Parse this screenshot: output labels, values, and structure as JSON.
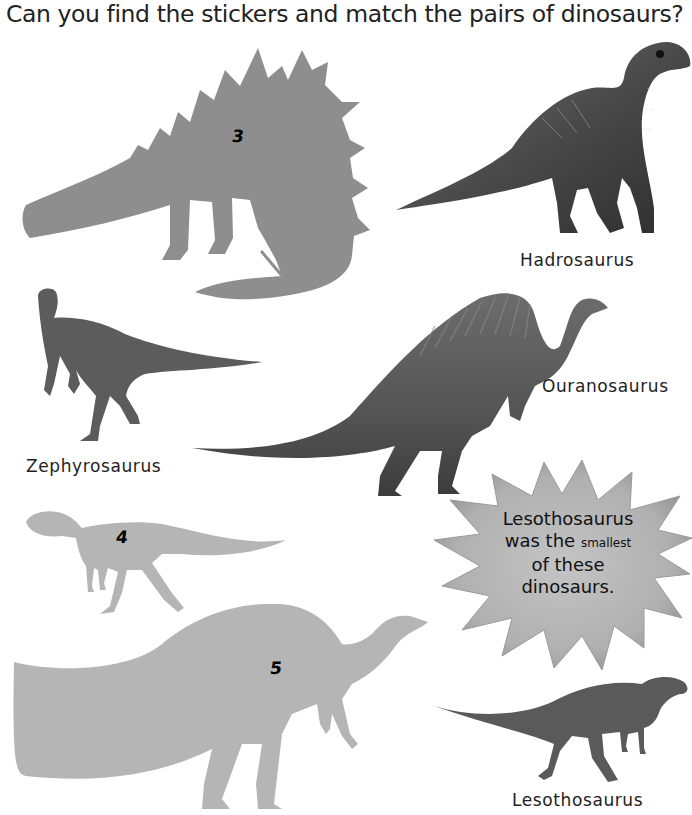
{
  "page": {
    "title": "Can you find the stickers and match the pairs of dinosaurs?"
  },
  "stickers": [
    {
      "number": "3",
      "shape": "stegosaur-silhouette",
      "color": "#8e8e8e"
    },
    {
      "number": "4",
      "shape": "lesothosaurus-silhouette",
      "color": "#b5b5b5"
    },
    {
      "number": "5",
      "shape": "ouranosaurus-silhouette",
      "color": "#b5b5b5"
    }
  ],
  "dinosaurs": [
    {
      "name": "Hadrosaurus"
    },
    {
      "name": "Zephyrosaurus"
    },
    {
      "name": "Ouranosaurus"
    },
    {
      "name": "Lesothosaurus"
    }
  ],
  "fact_star": {
    "line1": "Lesothosaurus",
    "line2_a": "was the",
    "line2_b": "smallest",
    "line3": "of these",
    "line4": "dinosaurs.",
    "color": "#b0b0b0"
  }
}
